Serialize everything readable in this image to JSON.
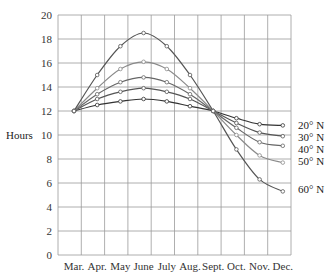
{
  "chart_data": {
    "type": "line",
    "title": "",
    "xlabel": "",
    "ylabel": "Hours",
    "ylim": [
      0,
      20
    ],
    "yticks": [
      0,
      2,
      4,
      6,
      8,
      10,
      12,
      14,
      16,
      18,
      20
    ],
    "grid": true,
    "categories": [
      "Mar.",
      "Apr.",
      "May",
      "June",
      "July",
      "Aug.",
      "Sept.",
      "Oct.",
      "Nov.",
      "Dec."
    ],
    "legend_position": "right, labels at line ends",
    "series": [
      {
        "name": "20° N",
        "color": "#333333",
        "values": [
          12.0,
          12.5,
          12.8,
          13.0,
          12.8,
          12.4,
          12.0,
          11.4,
          10.9,
          10.8
        ]
      },
      {
        "name": "30° N",
        "color": "#555555",
        "values": [
          12.0,
          13.0,
          13.6,
          13.9,
          13.6,
          13.0,
          12.0,
          11.0,
          10.2,
          9.9
        ]
      },
      {
        "name": "40° N",
        "color": "#666666",
        "values": [
          12.0,
          13.4,
          14.4,
          14.8,
          14.4,
          13.4,
          12.0,
          10.6,
          9.4,
          9.1
        ]
      },
      {
        "name": "50° N",
        "color": "#8a8a8a",
        "values": [
          12.0,
          13.9,
          15.5,
          16.1,
          15.5,
          13.9,
          12.0,
          10.0,
          8.3,
          7.7
        ]
      },
      {
        "name": "60° N",
        "color": "#555555",
        "values": [
          12.0,
          15.0,
          17.4,
          18.5,
          17.4,
          15.0,
          12.0,
          8.8,
          6.3,
          5.3
        ]
      }
    ]
  }
}
